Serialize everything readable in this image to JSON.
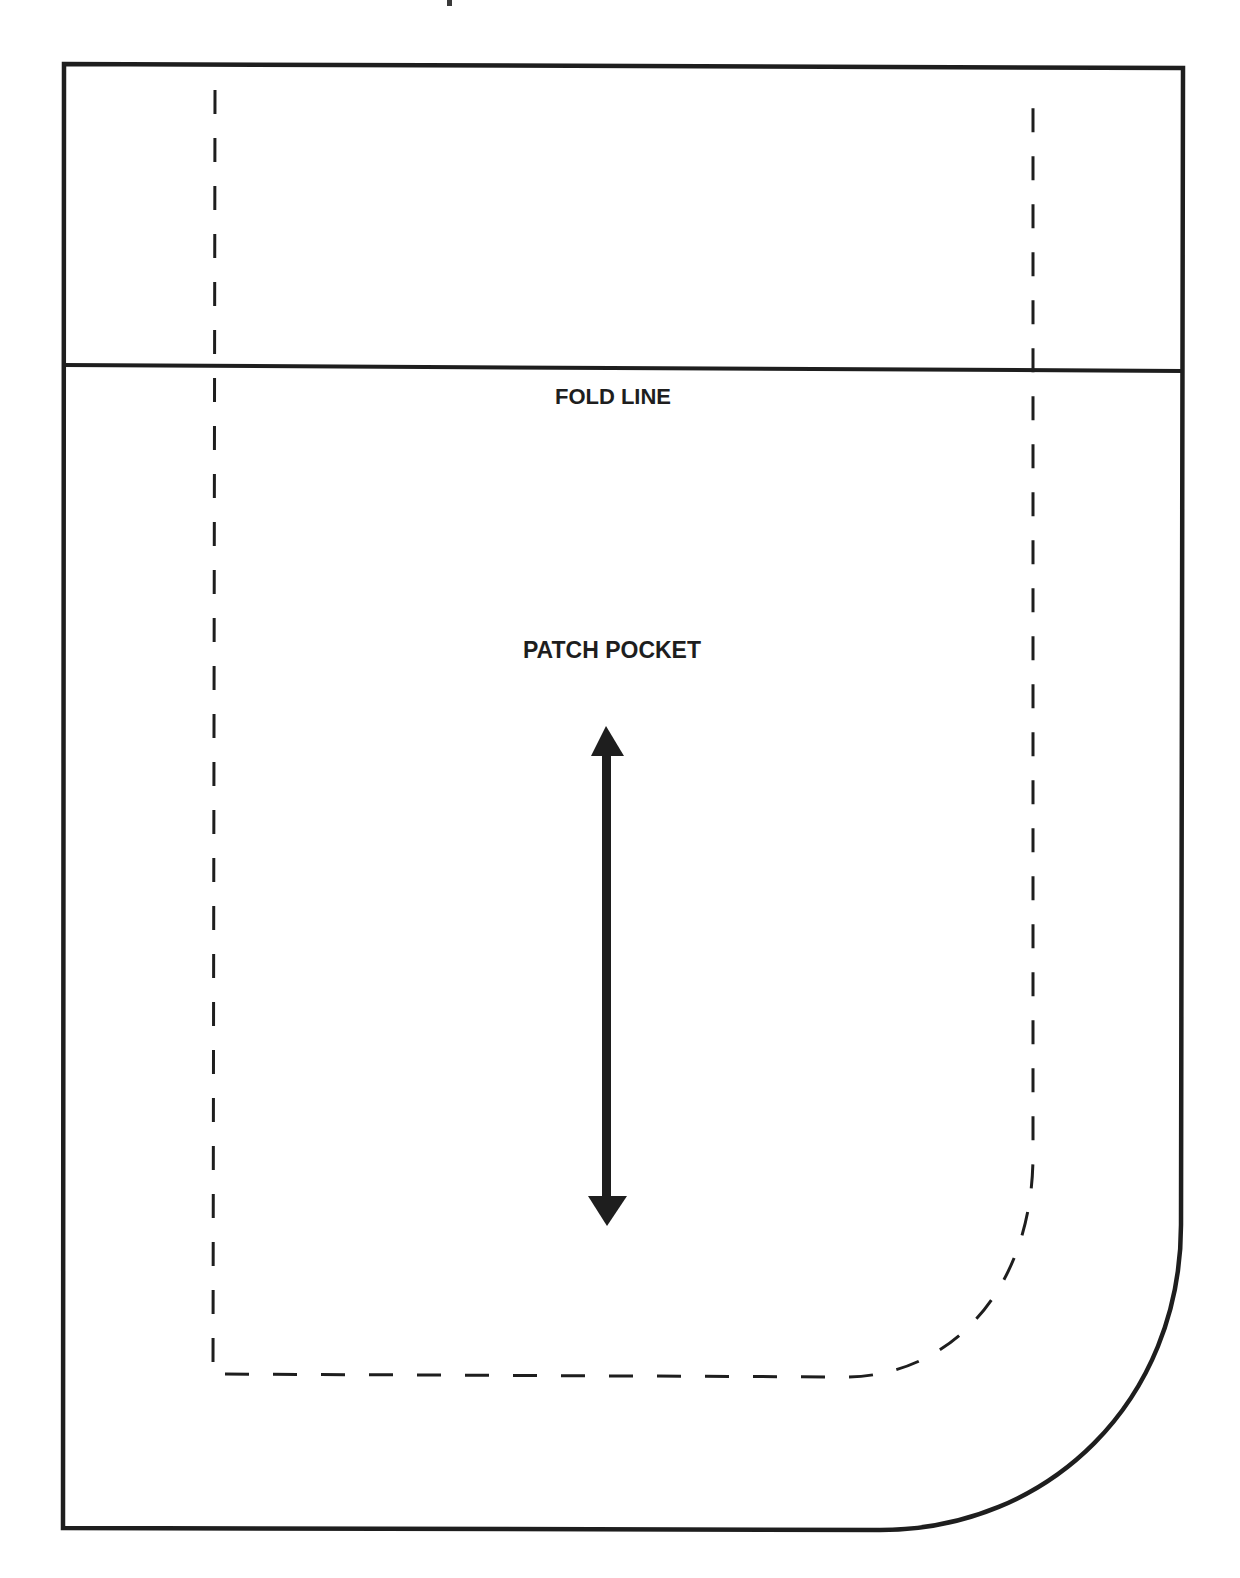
{
  "pattern_piece": {
    "name": "PATCH POCKET",
    "fold_label": "FOLD LINE",
    "grainline": "grain-line-double-arrow-icon",
    "colors": {
      "ink": "#1e1e1e",
      "paper": "#ffffff"
    },
    "lines": {
      "cut_line": "solid outline",
      "stitch_line": "dashed seam allowance",
      "fold_line": "solid horizontal"
    }
  }
}
